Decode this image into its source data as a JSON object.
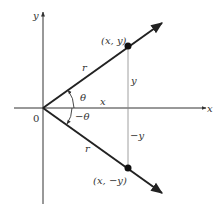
{
  "diagram": {
    "type": "coordinate-plane-reflection",
    "axes": {
      "x_label": "x",
      "y_label": "y",
      "origin_label": "0"
    },
    "points": [
      {
        "name": "upper-point",
        "label": "(x, y)"
      },
      {
        "name": "lower-point",
        "label": "(x, −y)"
      }
    ],
    "rays": [
      {
        "name": "upper-ray",
        "length_label": "r",
        "angle_label": "θ"
      },
      {
        "name": "lower-ray",
        "length_label": "r",
        "angle_label": "−θ"
      }
    ],
    "segments": {
      "x_label": "x",
      "y_label": "y",
      "neg_y_label": "−y"
    },
    "colors": {
      "line": "#222222",
      "thin_line": "#888888",
      "text": "#333333"
    }
  }
}
